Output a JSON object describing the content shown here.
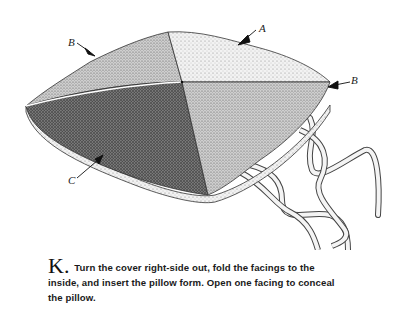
{
  "figure": {
    "labels": [
      {
        "id": "A",
        "text": "A"
      },
      {
        "id": "B-left",
        "text": "B"
      },
      {
        "id": "B-right",
        "text": "B"
      },
      {
        "id": "C",
        "text": "C"
      }
    ],
    "colors": {
      "ink": "#1a1a1a",
      "paper": "#ffffff",
      "shade_dark": "#4a4a4a",
      "shade_mid": "#9a9a9a",
      "shade_light": "#d6d6d6"
    }
  },
  "caption": {
    "step": "K.",
    "text": "Turn the cover right-side out, fold the facings to the inside, and insert the pillow form. Open one facing to conceal the pillow."
  }
}
